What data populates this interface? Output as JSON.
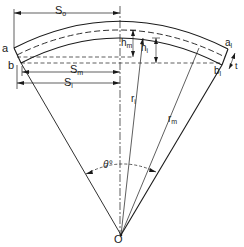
{
  "diagram": {
    "type": "circular arc segment geometry",
    "labels": {
      "S_o": {
        "base": "S",
        "sub": "o"
      },
      "S_m": {
        "base": "S",
        "sub": "m"
      },
      "S_i": {
        "base": "S",
        "sub": "i"
      },
      "h_m": {
        "base": "h",
        "sub": "m"
      },
      "h_i": {
        "base": "h",
        "sub": "i"
      },
      "r_i": {
        "base": "r",
        "sub": "i"
      },
      "r_m": {
        "base": "r",
        "sub": "m"
      },
      "a": "a",
      "b": "b",
      "a1": {
        "base": "a",
        "sub": "l"
      },
      "b1": {
        "base": "b",
        "sub": "l"
      },
      "t": "t",
      "theta": "θ°",
      "O": "O"
    },
    "colors": {
      "line": "#1a1a1a",
      "background": "#ffffff"
    }
  }
}
